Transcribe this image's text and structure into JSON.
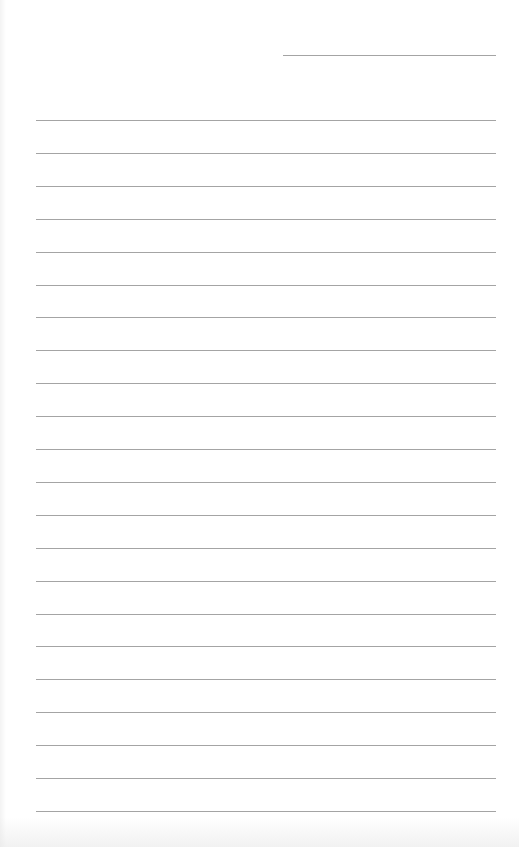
{
  "page": {
    "type": "lined-writing-page",
    "background_color": "#ffffff",
    "line_color": "#a4a4a4",
    "header_line": {
      "x_start": 283,
      "x_end": 496,
      "y": 55
    },
    "ruled_lines": {
      "count": 22,
      "x_start": 36,
      "x_end": 496,
      "first_y": 120,
      "spacing": 32.9
    },
    "text_content": []
  }
}
